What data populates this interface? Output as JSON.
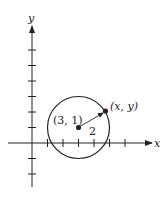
{
  "diagram": {
    "type": "circle-on-coordinate-plane",
    "axes": {
      "x_label": "x",
      "y_label": "y",
      "x_ticks": [
        1,
        2,
        3,
        4,
        5,
        6
      ],
      "y_ticks": [
        -2,
        -1,
        1,
        2,
        3,
        4,
        5,
        6,
        7
      ]
    },
    "circle": {
      "center_label": "(3, 1)",
      "center": [
        3,
        1
      ],
      "radius": 2,
      "radius_label": "2"
    },
    "point": {
      "label": "(x, y)"
    },
    "colors": {
      "stroke": "#222222",
      "background": "#ffffff"
    }
  }
}
